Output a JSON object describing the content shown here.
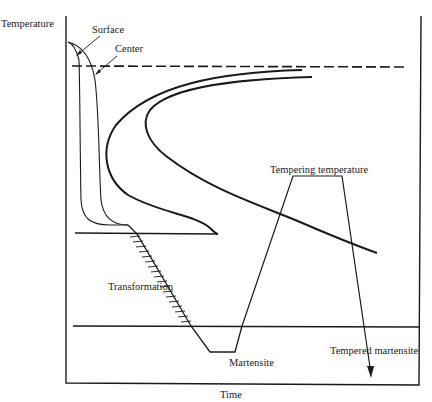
{
  "diagram": {
    "axes": {
      "y_label": "Temperature",
      "x_label": "Time"
    },
    "labels": {
      "surface": "Surface",
      "center": "Center",
      "tempering_temperature": "Tempering temperature",
      "transformation": "Transformation",
      "martensite": "Martensite",
      "tempered_martensite": "Tempered martensite"
    },
    "colors": {
      "line": "#1a1a1a",
      "background": "#ffffff"
    },
    "elements": [
      "frame-box",
      "dashed-line (A1/eutectoid temperature)",
      "TTT start curve (C-curve)",
      "TTT finish curve (C-curve)",
      "Ms horizontal line",
      "Mf horizontal line",
      "surface cooling curve",
      "center cooling curve",
      "hatched transformation line",
      "tempering cycle trapezoid",
      "arrow to tempered martensite"
    ]
  }
}
